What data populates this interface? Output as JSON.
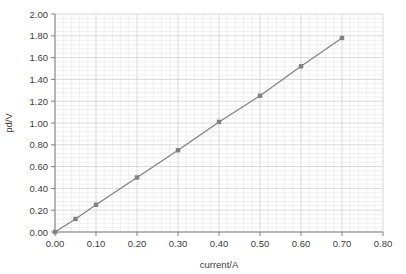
{
  "chart_data": {
    "type": "line",
    "title": "",
    "xlabel": "current/A",
    "ylabel": "pd/V",
    "xlim": [
      0.0,
      0.8
    ],
    "ylim": [
      0.0,
      2.0
    ],
    "x_ticks": [
      "0.00",
      "0.10",
      "0.20",
      "0.30",
      "0.40",
      "0.50",
      "0.60",
      "0.70",
      "0.80"
    ],
    "x_tick_values": [
      0.0,
      0.1,
      0.2,
      0.3,
      0.4,
      0.5,
      0.6,
      0.7,
      0.8
    ],
    "y_ticks": [
      "0.00",
      "0.20",
      "0.40",
      "0.60",
      "0.80",
      "1.00",
      "1.20",
      "1.40",
      "1.60",
      "1.80",
      "2.00"
    ],
    "y_tick_values": [
      0.0,
      0.2,
      0.4,
      0.6,
      0.8,
      1.0,
      1.2,
      1.4,
      1.6,
      1.8,
      2.0
    ],
    "grid": true,
    "minor_grid": true,
    "minor_divisions": 5,
    "legend": null,
    "legend_position": "none",
    "x": [
      0.0,
      0.05,
      0.1,
      0.2,
      0.3,
      0.4,
      0.5,
      0.6,
      0.7
    ],
    "values": [
      0.0,
      0.12,
      0.25,
      0.5,
      0.75,
      1.01,
      1.25,
      1.52,
      1.78
    ],
    "series": [
      {
        "name": "pd/V vs current/A",
        "x": [
          0.0,
          0.05,
          0.1,
          0.2,
          0.3,
          0.4,
          0.5,
          0.6,
          0.7
        ],
        "values": [
          0.0,
          0.12,
          0.25,
          0.5,
          0.75,
          1.01,
          1.25,
          1.52,
          1.78
        ],
        "color": "#808080",
        "marker": "square",
        "line_style": "solid"
      }
    ],
    "colors": {
      "line": "#808080",
      "marker": "#808080",
      "axis": "#808080",
      "major_grid": "#d9d9d9",
      "minor_grid": "#efefef",
      "text": "#3b3b3b",
      "background": "#ffffff"
    }
  }
}
